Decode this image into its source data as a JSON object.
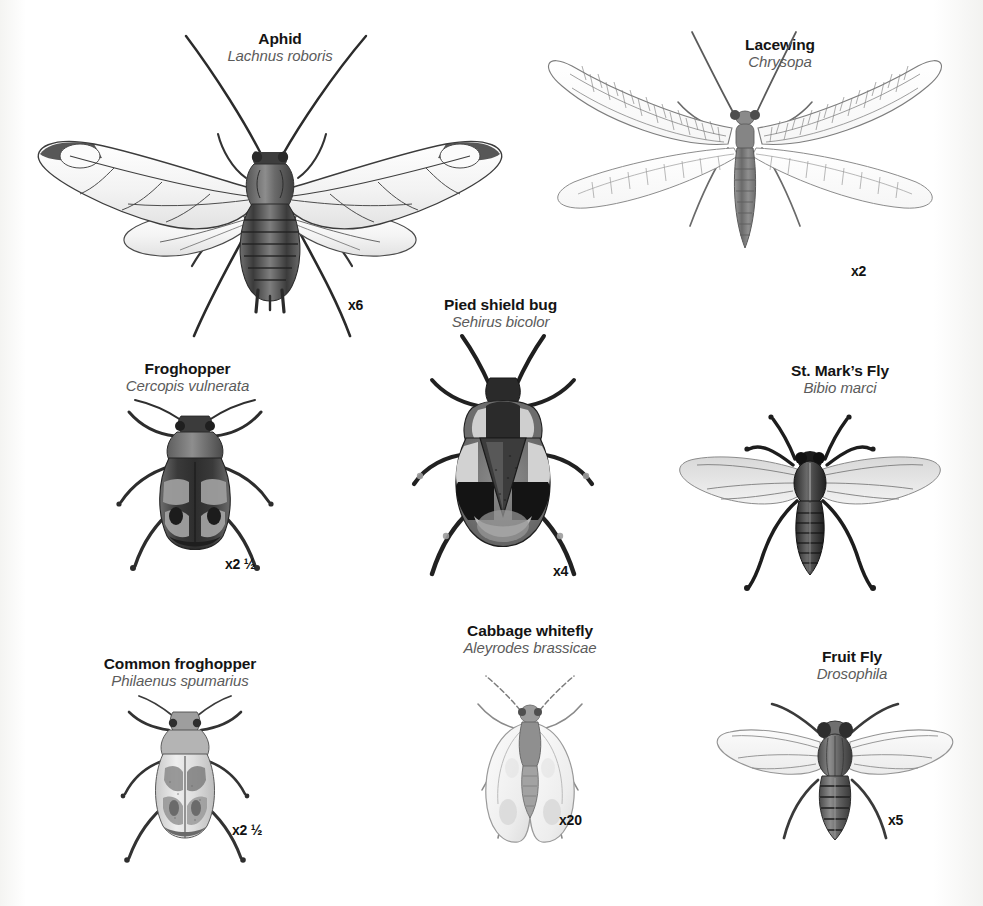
{
  "plate": {
    "title": "Insect identification plate",
    "background_color": "#ffffff",
    "text_color": "#141414",
    "latin_color": "#5b5b5b"
  },
  "specimens": [
    {
      "id": "aphid",
      "common_name": "Aphid",
      "latin_name": "Lachnus roboris",
      "magnification": "x6",
      "icon": "aphid-winged-illustration"
    },
    {
      "id": "lacewing",
      "common_name": "Lacewing",
      "latin_name": "Chrysopa",
      "magnification": "x2",
      "icon": "lacewing-illustration"
    },
    {
      "id": "froghopper",
      "common_name": "Froghopper",
      "latin_name": "Cercopis vulnerata",
      "magnification": "x2 ½",
      "icon": "froghopper-illustration"
    },
    {
      "id": "pied-shield-bug",
      "common_name": "Pied shield bug",
      "latin_name": "Sehirus bicolor",
      "magnification": "x4",
      "icon": "shield-bug-illustration"
    },
    {
      "id": "st-marks-fly",
      "common_name": "St. Mark’s Fly",
      "latin_name": "Bibio marci",
      "magnification": "",
      "icon": "st-marks-fly-illustration"
    },
    {
      "id": "common-froghopper",
      "common_name": "Common froghopper",
      "latin_name": "Philaenus spumarius",
      "magnification": "x2 ½",
      "icon": "common-froghopper-illustration"
    },
    {
      "id": "cabbage-whitefly",
      "common_name": "Cabbage whitefly",
      "latin_name": "Aleyrodes brassicae",
      "magnification": "x20",
      "icon": "whitefly-illustration"
    },
    {
      "id": "fruit-fly",
      "common_name": "Fruit Fly",
      "latin_name": "Drosophila",
      "magnification": "x5",
      "icon": "fruit-fly-illustration"
    }
  ]
}
